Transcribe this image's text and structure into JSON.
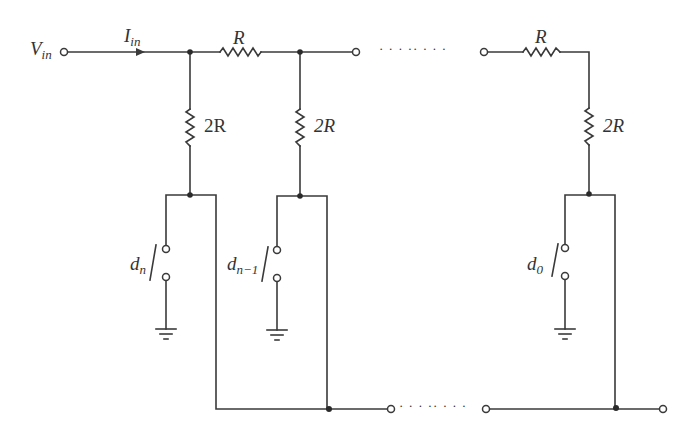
{
  "diagram": {
    "type": "circuit-schematic",
    "colors": {
      "wire": "#3a3a3a",
      "background": "#ffffff"
    },
    "labels": {
      "vin": {
        "main": "V",
        "sub": "in"
      },
      "iin": {
        "main": "I",
        "sub": "in"
      },
      "r1": "R",
      "r3": "R",
      "r2r_1": "2R",
      "r2r_2": "2R",
      "r2r_3": "2R",
      "switch_n": {
        "main": "d",
        "sub": "n"
      },
      "switch_n1": {
        "main": "d",
        "sub": "n−1"
      },
      "switch_0": {
        "main": "d",
        "sub": "0"
      },
      "top_ellipsis": "· · · ·· · · ·",
      "bottom_ellipsis": "· · · ·· · · ·"
    },
    "components": [
      {
        "id": "R_top_1",
        "kind": "resistor",
        "value": "R"
      },
      {
        "id": "R_top_last",
        "kind": "resistor",
        "value": "R"
      },
      {
        "id": "R_shunt_n",
        "kind": "resistor",
        "value": "2R"
      },
      {
        "id": "R_shunt_n1",
        "kind": "resistor",
        "value": "2R"
      },
      {
        "id": "R_shunt_0",
        "kind": "resistor",
        "value": "2R"
      },
      {
        "id": "S_n",
        "kind": "switch",
        "label": "d_n"
      },
      {
        "id": "S_n1",
        "kind": "switch",
        "label": "d_n-1"
      },
      {
        "id": "S_0",
        "kind": "switch",
        "label": "d_0"
      }
    ]
  }
}
